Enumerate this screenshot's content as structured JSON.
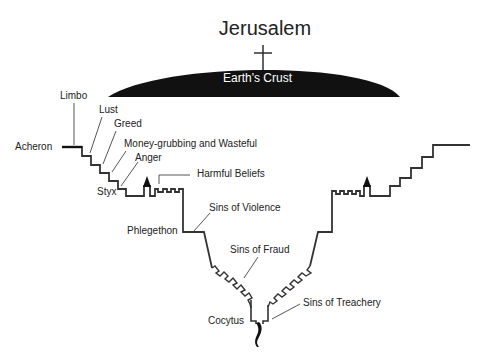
{
  "diagram": {
    "title": "Jerusalem",
    "crust_label": "Earth's Crust",
    "colors": {
      "ink": "#222222",
      "background": "#ffffff",
      "crust_text": "#ffffff"
    },
    "symbols": [
      "cross-icon",
      "castle-tower-icon-left",
      "castle-tower-icon-right",
      "lucifer-figure-icon"
    ],
    "labels": {
      "limbo": "Limbo",
      "lust": "Lust",
      "greed": "Greed",
      "acheron": "Acheron",
      "money": "Money-grubbing and Wasteful",
      "anger": "Anger",
      "styx": "Styx",
      "harmful": "Harmful Beliefs",
      "violence": "Sins of Violence",
      "phlegethon": "Phlegethon",
      "fraud": "Sins of Fraud",
      "treachery": "Sins of Treachery",
      "cocytus": "Cocytus"
    }
  }
}
